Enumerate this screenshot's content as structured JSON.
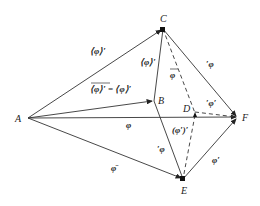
{
  "diagram": {
    "points": {
      "A": {
        "label": "A",
        "x": 28,
        "y": 118
      },
      "B": {
        "label": "B",
        "x": 154,
        "y": 101
      },
      "C": {
        "label": "C",
        "x": 163,
        "y": 29
      },
      "D": {
        "label": "D",
        "x": 195,
        "y": 115
      },
      "E": {
        "label": "E",
        "x": 183,
        "y": 179
      },
      "F": {
        "label": "F",
        "x": 238,
        "y": 117
      }
    },
    "edge_labels": {
      "AC": "⟨φ⟩′",
      "AB": "⟨φ⟩′ = ⟨φ⟩′",
      "AF": "φ",
      "AE": "φ̄",
      "CB": "⟨φ⟩′",
      "CD": "φ",
      "CF": "′φ",
      "DF": "′φ′",
      "BE": "′φ",
      "DE": "(φ′)′",
      "EF": "φ′"
    },
    "colors": {
      "stroke": "#333333",
      "text": "#222222",
      "background": "#ffffff"
    }
  }
}
